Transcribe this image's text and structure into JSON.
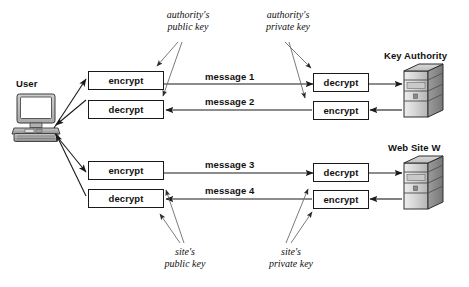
{
  "diagram": {
    "actors": {
      "user": {
        "label": "User",
        "icon": "desktop-computer-icon"
      },
      "key_authority": {
        "label": "Key Authority",
        "icon": "server-tower-icon"
      },
      "web_site": {
        "label": "Web Site W",
        "icon": "server-tower-icon"
      }
    },
    "operations": {
      "encrypt": "encrypt",
      "decrypt": "decrypt"
    },
    "user_side_boxes": [
      {
        "id": "user-encrypt-authority",
        "op": "encrypt"
      },
      {
        "id": "user-decrypt-authority",
        "op": "decrypt"
      },
      {
        "id": "user-encrypt-site",
        "op": "encrypt"
      },
      {
        "id": "user-decrypt-site",
        "op": "decrypt"
      }
    ],
    "remote_side_boxes": [
      {
        "id": "authority-decrypt",
        "op": "decrypt"
      },
      {
        "id": "authority-encrypt",
        "op": "encrypt"
      },
      {
        "id": "site-decrypt",
        "op": "decrypt"
      },
      {
        "id": "site-encrypt",
        "op": "encrypt"
      }
    ],
    "messages": [
      {
        "id": "message-1",
        "label": "message 1",
        "direction": "user-to-key-authority"
      },
      {
        "id": "message-2",
        "label": "message 2",
        "direction": "key-authority-to-user"
      },
      {
        "id": "message-3",
        "label": "message 3",
        "direction": "user-to-web-site"
      },
      {
        "id": "message-4",
        "label": "message 4",
        "direction": "web-site-to-user"
      }
    ],
    "key_annotations": [
      {
        "id": "authority-public-key",
        "line1": "authority's",
        "line2": "public key"
      },
      {
        "id": "authority-private-key",
        "line1": "authority's",
        "line2": "private key"
      },
      {
        "id": "site-public-key",
        "line1": "site's",
        "line2": "public key"
      },
      {
        "id": "site-private-key",
        "line1": "site's",
        "line2": "private key"
      }
    ],
    "colors": {
      "stroke": "#1a1a1a",
      "thin_stroke": "#5a5a5a",
      "background": "#ffffff",
      "server_front": "#d8d8d8",
      "server_side": "#9a9a9a",
      "server_top": "#c2c2c2",
      "monitor_body": "#bdbdbd"
    }
  }
}
